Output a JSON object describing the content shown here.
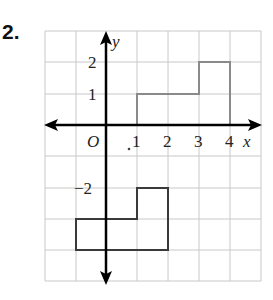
{
  "problem_number": "2.",
  "axes": {
    "x_label": "x",
    "y_label": "y",
    "origin_label": "O",
    "x_tick_labels": [
      "1",
      "2",
      "3",
      "4"
    ],
    "y_tick_labels": [
      "2",
      "1",
      "−2"
    ]
  },
  "grid": {
    "x_range": [
      -2,
      5
    ],
    "y_range": [
      -5,
      3
    ],
    "color": "#c8c8c8"
  },
  "colors": {
    "axis": "#000000",
    "shape_upper": "#8a8a8a",
    "shape_lower": "#3a3a3a"
  },
  "shapes": {
    "upper_polygon": {
      "vertices": [
        [
          1,
          0
        ],
        [
          1,
          1
        ],
        [
          3,
          1
        ],
        [
          3,
          2
        ],
        [
          4,
          2
        ],
        [
          4,
          0
        ]
      ]
    },
    "lower_polygon": {
      "vertices": [
        [
          -1,
          -3
        ],
        [
          -1,
          -4
        ],
        [
          2,
          -4
        ],
        [
          2,
          -2
        ],
        [
          1,
          -2
        ],
        [
          1,
          -3
        ]
      ]
    }
  }
}
